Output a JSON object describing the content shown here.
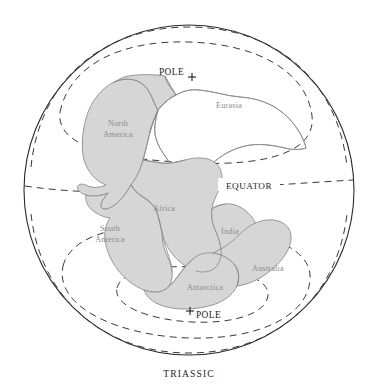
{
  "figure": {
    "caption": "TRIASSIC",
    "type": "paleogeographic-globe-map",
    "projection_note": "orthographic globe",
    "background_color": "#ffffff",
    "land_fill_color": "#d6d6d6",
    "land_stroke_color": "#8e8e8e",
    "line_color": "#2b2b2b"
  },
  "globe": {
    "center_x": 189,
    "center_y": 190,
    "radius": 165
  },
  "annotations": {
    "north_pole_label": "POLE",
    "south_pole_label": "POLE",
    "equator_label": "EQUATOR"
  },
  "continents": [
    {
      "id": "north-america",
      "label": "North America",
      "line1": "North",
      "line2": "America",
      "label_x": 118,
      "label_y": 128
    },
    {
      "id": "eurasia",
      "label": "Eurasia",
      "line1": "Eurasia",
      "line2": "",
      "label_x": 229,
      "label_y": 106
    },
    {
      "id": "africa",
      "label": "Africa",
      "line1": "Africa",
      "line2": "",
      "label_x": 164,
      "label_y": 208
    },
    {
      "id": "south-america",
      "label": "South America",
      "line1": "South",
      "line2": "America",
      "label_x": 110,
      "label_y": 232
    },
    {
      "id": "india",
      "label": "India",
      "line1": "India",
      "line2": "",
      "label_x": 229,
      "label_y": 231
    },
    {
      "id": "antarctica",
      "label": "Antarctica",
      "line1": "Antarctica",
      "line2": "",
      "label_x": 205,
      "label_y": 288
    },
    {
      "id": "australia",
      "label": "Australia",
      "line1": "Australia",
      "line2": "",
      "label_x": 268,
      "label_y": 269
    }
  ]
}
